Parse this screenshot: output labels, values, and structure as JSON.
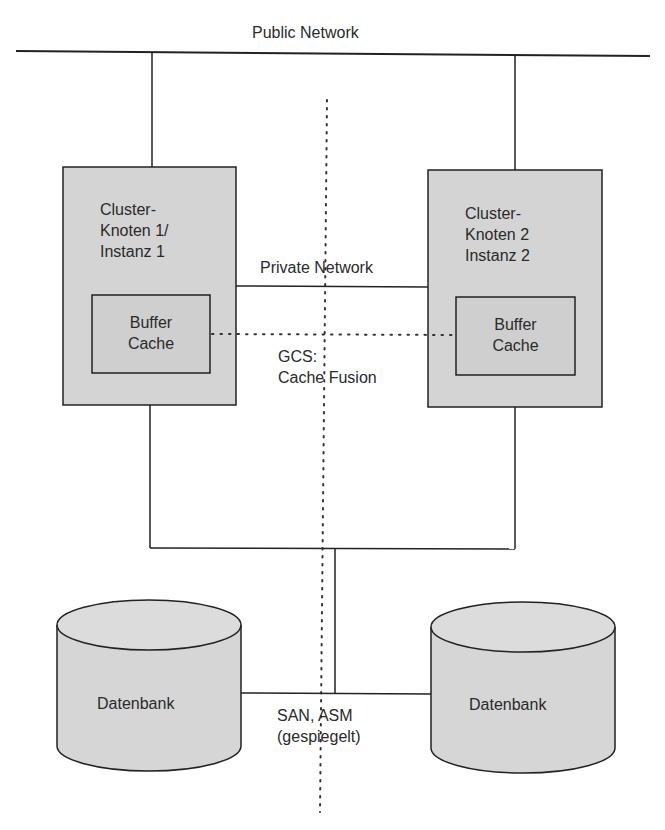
{
  "diagram": {
    "type": "cluster-architecture",
    "public_network": {
      "label": "Public Network"
    },
    "private_network": {
      "label": "Private Network"
    },
    "node1": {
      "title_lines": [
        "Cluster-",
        "Knoten 1/",
        "Instanz 1"
      ],
      "buffer_cache_lines": [
        "Buffer",
        "Cache"
      ]
    },
    "node2": {
      "title_lines": [
        "Cluster-",
        "Knoten 2",
        "Instanz 2"
      ],
      "buffer_cache_lines": [
        "Buffer",
        "Cache"
      ]
    },
    "gcs": {
      "lines": [
        "GCS:",
        "Cache Fusion"
      ]
    },
    "storage": {
      "lines": [
        "SAN, ASM",
        "(gespiegelt)"
      ]
    },
    "database_left": {
      "label": "Datenbank"
    },
    "database_right": {
      "label": "Datenbank"
    },
    "colors": {
      "line": "#222222",
      "box_fill": "#d4d4d4",
      "cache_fill": "#cfcfcf",
      "db_fill": "#d6d6d6",
      "background": "#ffffff"
    }
  }
}
